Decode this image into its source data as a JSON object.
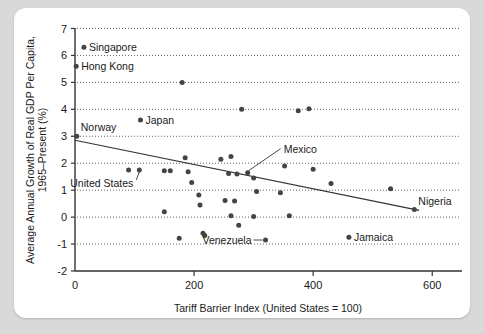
{
  "chart_data": {
    "type": "scatter",
    "title": "",
    "xlabel": "Tariff Barrier Index (United States = 100)",
    "ylabel": "Average Annual Growth of Real GDP Per Capita, 1965–Present (%)",
    "xlim": [
      0,
      650
    ],
    "ylim": [
      -2,
      7
    ],
    "xticks": [
      0,
      200,
      400,
      600
    ],
    "xtick_labels": [
      "0",
      "200",
      "400",
      "600"
    ],
    "yticks": [
      -2,
      -1,
      0,
      1,
      2,
      3,
      4,
      5,
      6,
      7
    ],
    "ytick_labels": [
      "-2",
      "-1",
      "0",
      "1",
      "2",
      "3",
      "4",
      "5",
      "6",
      "7"
    ],
    "grid": "horizontal-dotted",
    "legend": "none",
    "points": [
      {
        "x": 15,
        "y": 6.3,
        "label": "Singapore",
        "label_pos": "right"
      },
      {
        "x": 2,
        "y": 5.6,
        "label": "Hong Kong",
        "label_pos": "right"
      },
      {
        "x": 180,
        "y": 5.0,
        "label": ""
      },
      {
        "x": 110,
        "y": 3.6,
        "label": "Japan",
        "label_pos": "right"
      },
      {
        "x": 3,
        "y": 3.0,
        "label": "Norway",
        "label_pos": "above-right"
      },
      {
        "x": 280,
        "y": 4.0,
        "label": ""
      },
      {
        "x": 375,
        "y": 3.95,
        "label": ""
      },
      {
        "x": 393,
        "y": 4.02,
        "label": ""
      },
      {
        "x": 90,
        "y": 1.75,
        "label": ""
      },
      {
        "x": 108,
        "y": 1.75,
        "label": "United States",
        "label_pos": "below-leader"
      },
      {
        "x": 150,
        "y": 1.72,
        "label": ""
      },
      {
        "x": 160,
        "y": 1.72,
        "label": ""
      },
      {
        "x": 185,
        "y": 2.2,
        "label": ""
      },
      {
        "x": 190,
        "y": 1.68,
        "label": ""
      },
      {
        "x": 196,
        "y": 1.28,
        "label": ""
      },
      {
        "x": 208,
        "y": 0.82,
        "label": ""
      },
      {
        "x": 210,
        "y": 0.45,
        "label": ""
      },
      {
        "x": 150,
        "y": 0.2,
        "label": ""
      },
      {
        "x": 175,
        "y": -0.78,
        "label": ""
      },
      {
        "x": 215,
        "y": -0.6,
        "label": ""
      },
      {
        "x": 218,
        "y": -0.68,
        "label": ""
      },
      {
        "x": 245,
        "y": 2.15,
        "label": ""
      },
      {
        "x": 262,
        "y": 2.25,
        "label": ""
      },
      {
        "x": 258,
        "y": 1.62,
        "label": ""
      },
      {
        "x": 272,
        "y": 1.6,
        "label": ""
      },
      {
        "x": 290,
        "y": 1.65,
        "label": "Mexico",
        "label_pos": "leader-up-right"
      },
      {
        "x": 300,
        "y": 1.45,
        "label": ""
      },
      {
        "x": 305,
        "y": 0.95,
        "label": ""
      },
      {
        "x": 252,
        "y": 0.62,
        "label": ""
      },
      {
        "x": 268,
        "y": 0.6,
        "label": ""
      },
      {
        "x": 262,
        "y": 0.05,
        "label": ""
      },
      {
        "x": 275,
        "y": -0.3,
        "label": ""
      },
      {
        "x": 300,
        "y": 0.02,
        "label": ""
      },
      {
        "x": 320,
        "y": -0.85,
        "label": "Venezuela",
        "label_pos": "left-leader"
      },
      {
        "x": 352,
        "y": 1.9,
        "label": ""
      },
      {
        "x": 345,
        "y": 0.9,
        "label": ""
      },
      {
        "x": 360,
        "y": 0.05,
        "label": ""
      },
      {
        "x": 400,
        "y": 1.78,
        "label": ""
      },
      {
        "x": 430,
        "y": 1.25,
        "label": ""
      },
      {
        "x": 460,
        "y": -0.75,
        "label": "Jamaica",
        "label_pos": "right"
      },
      {
        "x": 530,
        "y": 1.05,
        "label": ""
      },
      {
        "x": 570,
        "y": 0.28,
        "label": "Nigeria",
        "label_pos": "above-right"
      }
    ],
    "trendline": {
      "x0": 0,
      "y0": 2.85,
      "x1": 578,
      "y1": 0.25
    },
    "annotations": [
      {
        "text": "Singapore",
        "x": 15,
        "y": 6.3
      },
      {
        "text": "Hong Kong",
        "x": 2,
        "y": 5.6
      },
      {
        "text": "Japan",
        "x": 110,
        "y": 3.6
      },
      {
        "text": "Norway",
        "x": 3,
        "y": 3.0
      },
      {
        "text": "United States",
        "x": 108,
        "y": 1.75
      },
      {
        "text": "Mexico",
        "x": 290,
        "y": 1.65
      },
      {
        "text": "Venezuela",
        "x": 320,
        "y": -0.85
      },
      {
        "text": "Jamaica",
        "x": 460,
        "y": -0.75
      },
      {
        "text": "Nigeria",
        "x": 570,
        "y": 0.28
      }
    ]
  },
  "labels": {
    "singapore": "Singapore",
    "hong_kong": "Hong Kong",
    "japan": "Japan",
    "norway": "Norway",
    "united_states": "United States",
    "mexico": "Mexico",
    "venezuela": "Venezuela",
    "jamaica": "Jamaica",
    "nigeria": "Nigeria"
  },
  "axes": {
    "x_title": "Tariff Barrier Index (United States = 100)",
    "y_title_line1": "Average Annual Growth of Real GDP Per Capita,",
    "y_title_line2": "1965–Present (%)",
    "x_ticks": [
      "0",
      "200",
      "400",
      "600"
    ],
    "y_ticks": [
      "7",
      "6",
      "5",
      "4",
      "3",
      "2",
      "1",
      "0",
      "-1",
      "-2"
    ]
  },
  "colors": {
    "background": "#d9d9d9",
    "panel": "#ffffff",
    "dot": "#444444",
    "axis": "#333333",
    "grid": "#555555"
  }
}
